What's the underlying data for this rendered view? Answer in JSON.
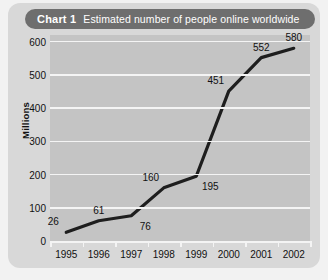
{
  "card": {
    "title_prefix": "Chart 1",
    "title_text": "Estimated number of people online worldwide",
    "pill_color": "#6e6e6e",
    "card_color": "#d8d8d8",
    "plot_color": "#c4c4c4",
    "grid_color": "#f4f4f4",
    "line_color": "#1e1e1e"
  },
  "chart_data": {
    "type": "line",
    "title": "Chart 1  Estimated number of people online worldwide",
    "xlabel": "",
    "ylabel": "Millions",
    "categories": [
      "1995",
      "1996",
      "1997",
      "1998",
      "1999",
      "2000",
      "2001",
      "2002"
    ],
    "values": [
      26,
      61,
      76,
      160,
      195,
      451,
      552,
      580
    ],
    "point_labels": [
      "26",
      "61",
      "76",
      "160",
      "195",
      "451",
      "552",
      "580"
    ],
    "label_positions": [
      "above-left",
      "above",
      "below-right",
      "above-left",
      "below-right",
      "above-left",
      "above",
      "above"
    ],
    "ylim": [
      0,
      620
    ],
    "yticks": [
      0,
      100,
      200,
      300,
      400,
      500,
      600
    ],
    "ytick_labels": [
      "0",
      "100",
      "200",
      "300",
      "400",
      "500",
      "600"
    ],
    "grid": true,
    "grid_axis": "y",
    "legend": "none",
    "series": [
      {
        "name": "Estimated number of people online worldwide",
        "values": [
          26,
          61,
          76,
          160,
          195,
          451,
          552,
          580
        ]
      }
    ]
  }
}
